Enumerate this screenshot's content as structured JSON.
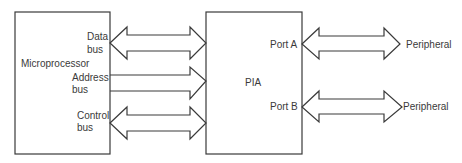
{
  "diagram": {
    "blocks": [
      {
        "id": "microprocessor",
        "label": "Microprocessor"
      },
      {
        "id": "pia",
        "label": "PIA"
      }
    ],
    "buses": [
      {
        "id": "data",
        "label_line1": "Data",
        "label_line2": "bus",
        "direction": "bidirectional"
      },
      {
        "id": "address",
        "label_line1": "Address",
        "label_line2": "bus",
        "direction": "to-pia"
      },
      {
        "id": "control",
        "label_line1": "Control",
        "label_line2": "bus",
        "direction": "bidirectional"
      }
    ],
    "ports": [
      {
        "id": "port-a",
        "label": "Port A",
        "peripheral": "Peripheral"
      },
      {
        "id": "port-b",
        "label": "Port B",
        "peripheral": "Peripheral"
      }
    ]
  }
}
